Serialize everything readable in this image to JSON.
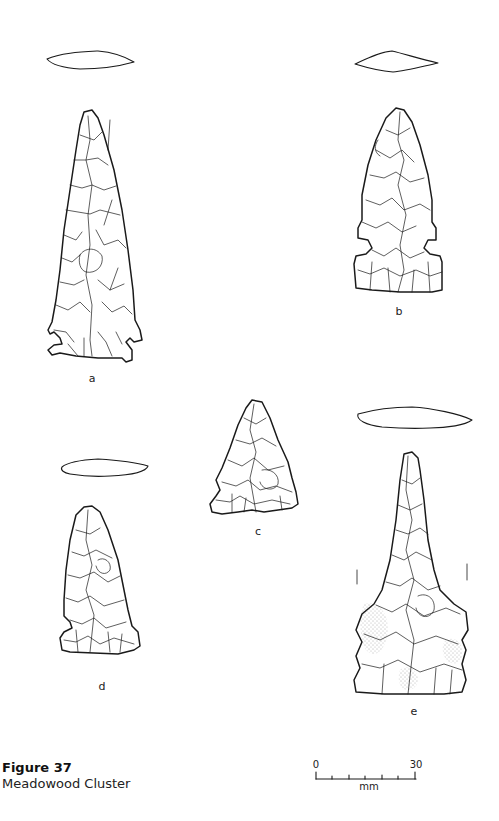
{
  "figure": {
    "number": "Figure 37",
    "title": "Meadowood Cluster"
  },
  "specimens": [
    {
      "id": "a",
      "label": "a"
    },
    {
      "id": "b",
      "label": "b"
    },
    {
      "id": "c",
      "label": "c"
    },
    {
      "id": "d",
      "label": "d"
    },
    {
      "id": "e",
      "label": "e"
    }
  ],
  "scale_bar": {
    "min_label": "0",
    "max_label": "30",
    "unit": "mm"
  },
  "colors": {
    "ink": "#1a1a1a",
    "paper": "#ffffff",
    "stipple": "#555555"
  }
}
